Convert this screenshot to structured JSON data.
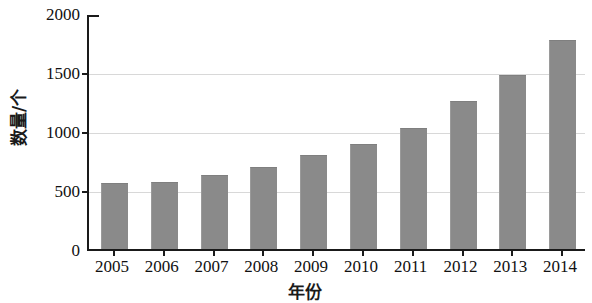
{
  "chart_data": {
    "type": "bar",
    "title": "",
    "xlabel": "年份",
    "ylabel": "数量/个",
    "categories": [
      "2005",
      "2006",
      "2007",
      "2008",
      "2009",
      "2010",
      "2011",
      "2012",
      "2013",
      "2014"
    ],
    "values": [
      550,
      560,
      620,
      685,
      790,
      880,
      1020,
      1245,
      1465,
      1760
    ],
    "series": [
      {
        "name": "数量",
        "values": [
          550,
          560,
          620,
          685,
          790,
          880,
          1020,
          1245,
          1465,
          1760
        ]
      }
    ],
    "ylim": [
      0,
      2000
    ],
    "y_ticks": [
      0,
      500,
      1000,
      1500,
      2000
    ],
    "y_tick_labels": [
      "0",
      "500",
      "1000",
      "1500",
      "2000"
    ],
    "grid": true,
    "grid_axis": "y",
    "legend": false,
    "legend_position": "none",
    "bar_color": "#8a8a8a",
    "axis_color": "#1a1a1a",
    "gridline_color": "#d8d8d8",
    "background_color": "#ffffff"
  }
}
